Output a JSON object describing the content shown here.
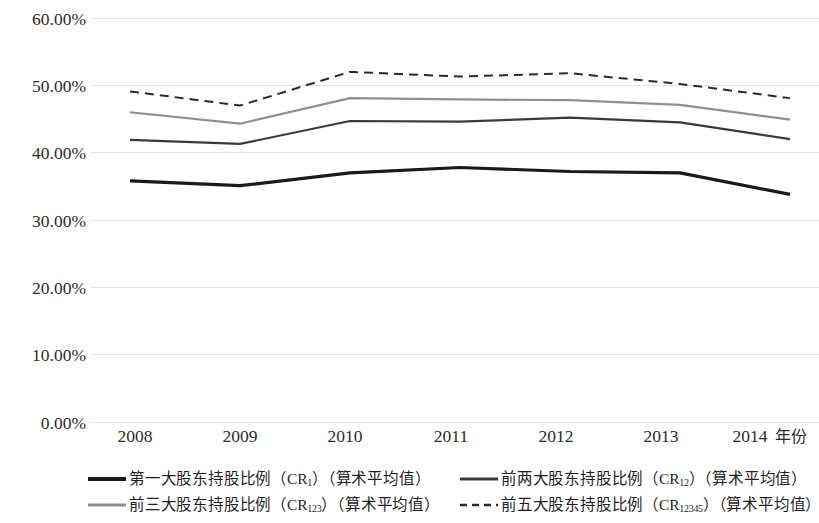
{
  "chart_data": {
    "type": "line",
    "title": "",
    "subtitle": "",
    "xlabel": "年份",
    "ylabel": "",
    "x": [
      "2008",
      "2009",
      "2010",
      "2011",
      "2012",
      "2013",
      "2014"
    ],
    "categories": [
      "2008",
      "2009",
      "2010",
      "2011",
      "2012",
      "2013",
      "2014"
    ],
    "ylim": [
      0,
      60
    ],
    "ytick_values": [
      0,
      10,
      20,
      30,
      40,
      50,
      60
    ],
    "ytick_labels": [
      "0.00%",
      "10.00%",
      "20.00%",
      "30.00%",
      "40.00%",
      "50.00%",
      "60.00%"
    ],
    "grid": true,
    "grid_axis": "y",
    "legend_position": "bottom",
    "series": [
      {
        "name": "第一大股东持股比例（CR1）（算术平均值）",
        "label_prefix": "第一大股东持股比例（CR",
        "label_sub": "1",
        "label_suffix": "）（算术平均值）",
        "color": "#1a1a1a",
        "width": 3.2,
        "dash": "none",
        "values": [
          35.8,
          35.1,
          37.0,
          37.8,
          37.2,
          37.0,
          33.8
        ]
      },
      {
        "name": "前两大股东持股比例（CR12）（算术平均值）",
        "label_prefix": "前两大股东持股比例（CR",
        "label_sub": "12",
        "label_suffix": "）（算术平均值）",
        "color": "#3a3a3a",
        "width": 2.2,
        "dash": "none",
        "values": [
          41.9,
          41.3,
          44.7,
          44.6,
          45.2,
          44.5,
          42.0
        ]
      },
      {
        "name": "前三大股东持股比例（CR123）（算术平均值）",
        "label_prefix": "前三大股东持股比例（CR",
        "label_sub": "123",
        "label_suffix": "）（算术平均值）",
        "color": "#8f8f8f",
        "width": 2.2,
        "dash": "none",
        "values": [
          46.0,
          44.3,
          48.1,
          47.9,
          47.8,
          47.1,
          44.9
        ]
      },
      {
        "name": "前五大股东持股比例（CR12345）（算术平均值）",
        "label_prefix": "前五大股东持股比例（CR",
        "label_sub": "12345",
        "label_suffix": "）（算术平均值）",
        "color": "#2b2b2b",
        "width": 2.0,
        "dash": "9,6",
        "values": [
          49.1,
          47.0,
          52.0,
          51.3,
          51.8,
          50.2,
          48.1
        ]
      }
    ],
    "colors": {
      "gridline": "#e4e4e4",
      "text": "#2b2b2b",
      "background": "#ffffff"
    }
  }
}
